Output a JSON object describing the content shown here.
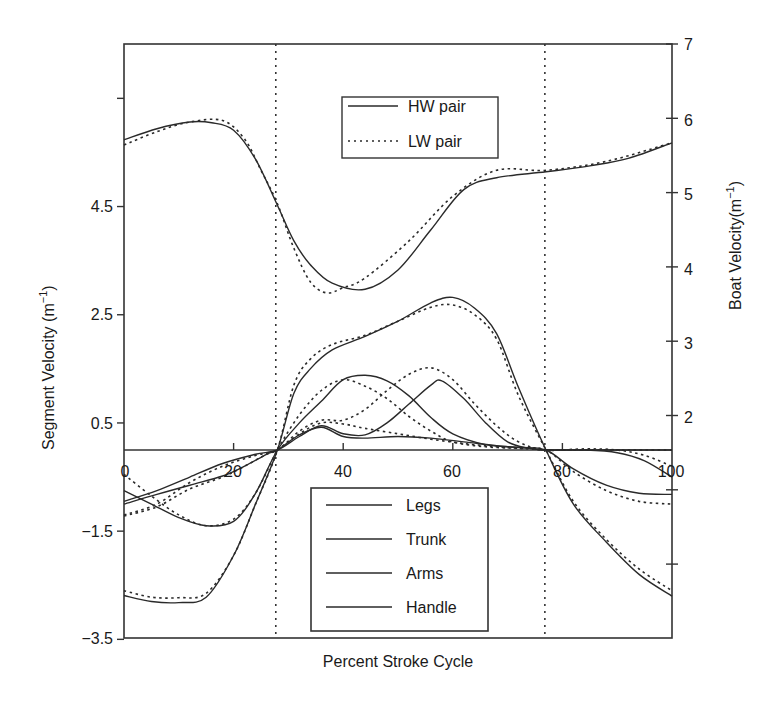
{
  "chart_data": {
    "type": "line",
    "title": "",
    "xlabel": "Percent Stroke Cycle",
    "ylabel": "Segment Velocity (m⁻¹)",
    "ylabel_right": "Boat Velocity(m⁻¹)",
    "xlim": [
      0,
      100
    ],
    "ylim": [
      -3.5,
      7.5
    ],
    "ylim_right": [
      -1,
      7
    ],
    "x_ticks": [
      "0",
      "20",
      "40",
      "60",
      "80",
      "100"
    ],
    "y_ticks_left": [
      "-3.5",
      "-1.5",
      "0.5",
      "2.5",
      "4.5"
    ],
    "y_ticks_left_unlabeled": [
      6.5
    ],
    "y_ticks_right": [
      "2",
      "3",
      "4",
      "5",
      "6",
      "7"
    ],
    "y_ticks_right_unlabeled": [
      1,
      0
    ],
    "vertical_markers": [
      27.7,
      76.8
    ],
    "legend_boat": [
      {
        "name": "HW pair",
        "style": "solid"
      },
      {
        "name": "LW pair",
        "style": "dotted"
      }
    ],
    "legend_segments": [
      {
        "name": "Legs",
        "style": "solid"
      },
      {
        "name": "Trunk",
        "style": "solid"
      },
      {
        "name": "Arms",
        "style": "solid"
      },
      {
        "name": "Handle",
        "style": "solid"
      }
    ],
    "series": [
      {
        "name": "Boat velocity HW pair",
        "axis": "right",
        "style": "solid",
        "x": [
          0,
          6,
          12,
          16,
          20,
          24,
          28,
          31,
          34,
          38,
          44,
          50,
          56,
          62,
          68,
          77,
          85,
          92,
          100
        ],
        "values": [
          5.71,
          5.86,
          5.95,
          5.94,
          5.84,
          5.45,
          4.83,
          4.35,
          4.03,
          3.78,
          3.7,
          3.96,
          4.5,
          5.04,
          5.2,
          5.28,
          5.36,
          5.46,
          5.67
        ]
      },
      {
        "name": "Boat velocity LW pair",
        "axis": "right",
        "style": "dotted",
        "x": [
          0,
          6,
          12,
          18,
          22,
          25,
          28,
          31,
          34,
          37,
          40,
          44,
          52,
          60,
          68,
          77,
          88,
          100
        ],
        "values": [
          5.64,
          5.82,
          5.95,
          5.97,
          5.72,
          5.3,
          4.85,
          4.25,
          3.8,
          3.65,
          3.72,
          3.85,
          4.35,
          4.95,
          5.3,
          5.3,
          5.42,
          5.67
        ]
      },
      {
        "name": "Handle HW",
        "axis": "left",
        "style": "solid",
        "x": [
          0,
          5,
          10,
          15,
          20,
          24,
          28,
          31,
          34,
          38,
          44,
          50,
          56,
          60,
          64,
          68,
          72,
          77,
          82,
          88,
          94,
          100
        ],
        "values": [
          -2.69,
          -2.8,
          -2.82,
          -2.72,
          -1.95,
          -1.0,
          0.0,
          1.05,
          1.5,
          1.85,
          2.1,
          2.38,
          2.72,
          2.82,
          2.62,
          2.15,
          1.15,
          0.0,
          -1.0,
          -1.7,
          -2.3,
          -2.7
        ]
      },
      {
        "name": "Handle LW",
        "axis": "left",
        "style": "dotted",
        "x": [
          0,
          5,
          10,
          15,
          20,
          24,
          28,
          31,
          34,
          38,
          44,
          50,
          56,
          60,
          64,
          68,
          72,
          77,
          82,
          88,
          94,
          100
        ],
        "values": [
          -2.6,
          -2.72,
          -2.73,
          -2.65,
          -1.95,
          -1.0,
          0.0,
          1.2,
          1.68,
          1.95,
          2.12,
          2.38,
          2.64,
          2.68,
          2.5,
          2.05,
          1.0,
          0.0,
          -0.95,
          -1.65,
          -2.2,
          -2.6
        ]
      },
      {
        "name": "Legs HW",
        "axis": "left",
        "style": "solid",
        "x": [
          0,
          5,
          10,
          15,
          20,
          24,
          28,
          32,
          36,
          40,
          44,
          48,
          52,
          56,
          60,
          66,
          72,
          77,
          82,
          88,
          94,
          100
        ],
        "values": [
          -0.75,
          -1.0,
          -1.25,
          -1.4,
          -1.32,
          -0.8,
          0.0,
          0.5,
          0.9,
          1.3,
          1.38,
          1.28,
          1.0,
          0.6,
          0.3,
          0.1,
          0.05,
          0.0,
          -0.35,
          -0.65,
          -0.8,
          -0.82
        ]
      },
      {
        "name": "Legs LW",
        "axis": "left",
        "style": "dotted",
        "x": [
          0,
          5,
          10,
          15,
          20,
          24,
          28,
          32,
          36,
          40,
          44,
          48,
          52,
          56,
          60,
          66,
          72,
          77,
          82,
          88,
          94,
          100
        ],
        "values": [
          -0.45,
          -0.85,
          -1.2,
          -1.4,
          -1.28,
          -0.8,
          0.0,
          0.65,
          1.1,
          1.3,
          1.18,
          0.95,
          0.62,
          0.35,
          0.15,
          0.06,
          0.03,
          0.0,
          -0.4,
          -0.75,
          -0.95,
          -1.0
        ]
      },
      {
        "name": "Trunk HW",
        "axis": "left",
        "style": "solid",
        "x": [
          0,
          6,
          12,
          18,
          24,
          28,
          32,
          36,
          40,
          44,
          48,
          52,
          56,
          58,
          62,
          66,
          70,
          74,
          77,
          84,
          90,
          95,
          100
        ],
        "values": [
          -0.95,
          -0.75,
          -0.5,
          -0.25,
          -0.08,
          0.0,
          0.25,
          0.45,
          0.3,
          0.28,
          0.5,
          0.85,
          1.2,
          1.28,
          0.95,
          0.5,
          0.15,
          0.03,
          0.0,
          0.0,
          -0.05,
          -0.2,
          -0.5
        ]
      },
      {
        "name": "Trunk LW",
        "axis": "left",
        "style": "dotted",
        "x": [
          0,
          6,
          12,
          18,
          24,
          28,
          32,
          36,
          40,
          44,
          48,
          52,
          56,
          60,
          64,
          68,
          72,
          77,
          84,
          90,
          95,
          100
        ],
        "values": [
          -1.2,
          -1.0,
          -0.6,
          -0.3,
          -0.1,
          0.0,
          0.35,
          0.55,
          0.55,
          0.75,
          1.1,
          1.4,
          1.52,
          1.3,
          0.85,
          0.45,
          0.15,
          0.0,
          0.02,
          0.0,
          -0.1,
          -0.3
        ]
      },
      {
        "name": "Arms HW",
        "axis": "left",
        "style": "solid",
        "x": [
          0,
          6,
          12,
          18,
          22,
          26,
          28,
          32,
          36,
          40,
          44,
          50,
          56,
          62,
          68,
          74,
          77,
          84,
          90,
          95,
          100
        ],
        "values": [
          -1.0,
          -0.82,
          -0.65,
          -0.48,
          -0.3,
          -0.08,
          0.0,
          0.28,
          0.42,
          0.25,
          0.22,
          0.25,
          0.22,
          0.15,
          0.08,
          0.03,
          0.0,
          0.0,
          0.0,
          0.0,
          0.0
        ]
      },
      {
        "name": "Arms LW",
        "axis": "left",
        "style": "dotted",
        "x": [
          0,
          6,
          12,
          18,
          22,
          26,
          28,
          32,
          36,
          40,
          44,
          50,
          56,
          62,
          68,
          74,
          77,
          84,
          90,
          95,
          100
        ],
        "values": [
          -1.22,
          -1.05,
          -0.72,
          -0.5,
          -0.3,
          -0.08,
          0.0,
          0.3,
          0.5,
          0.48,
          0.4,
          0.3,
          0.2,
          0.12,
          0.06,
          0.02,
          0.0,
          0.0,
          0.0,
          0.0,
          0.0
        ]
      }
    ]
  },
  "axes": {
    "xlabel": "Percent Stroke Cycle",
    "ylabel_left": "Segment Velocity (m",
    "ylabel_left_sup": "−1",
    "ylabel_left_close": ")",
    "ylabel_right": "Boat Velocity(m",
    "ylabel_right_sup": "−1",
    "ylabel_right_close": ")"
  },
  "legend_boat": {
    "hw": "HW pair",
    "lw": "LW pair"
  },
  "legend_segments": {
    "legs": "Legs",
    "trunk": "Trunk",
    "arms": "Arms",
    "handle": "Handle"
  },
  "colors": {
    "line": "#2a2a2a",
    "frame": "#333333",
    "background": "#ffffff"
  }
}
